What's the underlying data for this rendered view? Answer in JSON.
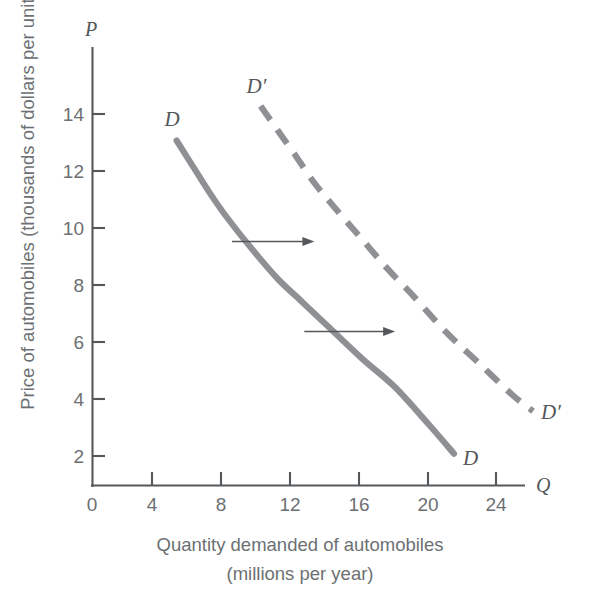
{
  "figure": {
    "background": "#ffffff",
    "curve_color": "#8e9093",
    "axis_color": "#55585a",
    "text_color": "#6c7073"
  },
  "axes": {
    "y_variable": "P",
    "x_variable": "Q",
    "y_axis_title": "Price of automobiles (thousands of dollars per unit)",
    "x_axis_title_line1": "Quantity demanded of automobiles",
    "x_axis_title_line2": "(millions per year)"
  },
  "labels": {
    "d_top": "D",
    "d_bottom": "D",
    "dprime_top": "D′",
    "dprime_bottom": "D′"
  },
  "chart_data": {
    "type": "line",
    "title": "",
    "xlabel": "Quantity demanded of automobiles (millions per year)",
    "ylabel": "Price of automobiles (thousands of dollars per unit)",
    "xlim": [
      0,
      27.5
    ],
    "ylim": [
      0,
      15.8
    ],
    "xticks": [
      0,
      4,
      8,
      12,
      16,
      20,
      24
    ],
    "yticks": [
      2,
      4,
      6,
      8,
      10,
      12,
      14
    ],
    "xticklabels": [
      "0",
      "4",
      "8",
      "12",
      "16",
      "20",
      "24"
    ],
    "yticklabels": [
      "2",
      "4",
      "6",
      "8",
      "10",
      "12",
      "14"
    ],
    "grid": false,
    "legend": "none",
    "series": [
      {
        "name": "D",
        "style": "solid",
        "label_positions": [
          "start",
          "end"
        ],
        "x": [
          5.0,
          6.0,
          7.0,
          8.0,
          9.5,
          11.0,
          12.5,
          14.0,
          16.0,
          18.0,
          20.0,
          21.5
        ],
        "y": [
          13.0,
          12.0,
          11.0,
          10.1,
          8.9,
          7.8,
          6.9,
          6.0,
          4.8,
          3.7,
          2.3,
          1.2
        ]
      },
      {
        "name": "D′",
        "style": "dashed",
        "label_positions": [
          "start",
          "end"
        ],
        "x": [
          10.0,
          11.0,
          12.0,
          13.2,
          14.5,
          16.0,
          17.5,
          19.0,
          21.0,
          23.0,
          25.0,
          26.2
        ],
        "y": [
          14.3,
          13.4,
          12.5,
          11.4,
          10.4,
          9.3,
          8.2,
          7.2,
          5.8,
          4.6,
          3.4,
          2.8
        ]
      }
    ],
    "annotations": [
      {
        "kind": "arrow",
        "label": "demand shift right at P≈9.2",
        "x_start": 8.3,
        "x_end": 13.2,
        "y": 9.2
      },
      {
        "kind": "arrow",
        "label": "demand shift right at P≈5.8",
        "x_start": 12.6,
        "x_end": 18.0,
        "y": 5.8
      }
    ]
  }
}
